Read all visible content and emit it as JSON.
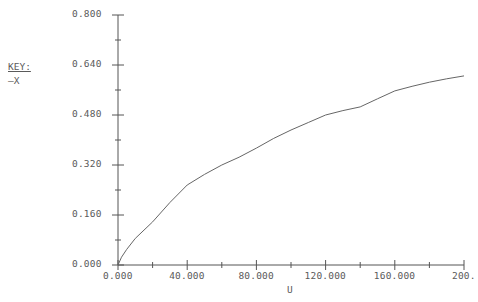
{
  "chart_data": {
    "type": "line",
    "title": "",
    "xlabel": "U",
    "ylabel": "",
    "xlim": [
      0,
      200
    ],
    "ylim": [
      0,
      0.8
    ],
    "grid": false,
    "legend_position": "left",
    "x_ticks": [
      "0.000",
      "40.000",
      "80.000",
      "120.000",
      "160.000",
      "200."
    ],
    "x_tick_values": [
      0,
      40,
      80,
      120,
      160,
      200
    ],
    "y_ticks": [
      "0.000",
      "0.160",
      "0.320",
      "0.480",
      "0.640",
      "0.800"
    ],
    "y_tick_values": [
      0,
      0.16,
      0.32,
      0.48,
      0.64,
      0.8
    ],
    "series": [
      {
        "name": "X",
        "color": "#666666",
        "x": [
          0,
          2,
          5,
          10,
          20,
          30,
          40,
          50,
          60,
          70,
          80,
          90,
          100,
          110,
          120,
          130,
          140,
          150,
          160,
          170,
          180,
          190,
          200
        ],
        "values": [
          0,
          0.025,
          0.05,
          0.085,
          0.138,
          0.2,
          0.256,
          0.29,
          0.32,
          0.345,
          0.374,
          0.405,
          0.432,
          0.456,
          0.48,
          0.494,
          0.506,
          0.532,
          0.557,
          0.572,
          0.585,
          0.596,
          0.605
        ]
      }
    ]
  },
  "legend": {
    "title": "KEY:",
    "entries": [
      {
        "symbol": "—",
        "label": "X"
      }
    ]
  },
  "axis": {
    "x_label": "U"
  }
}
